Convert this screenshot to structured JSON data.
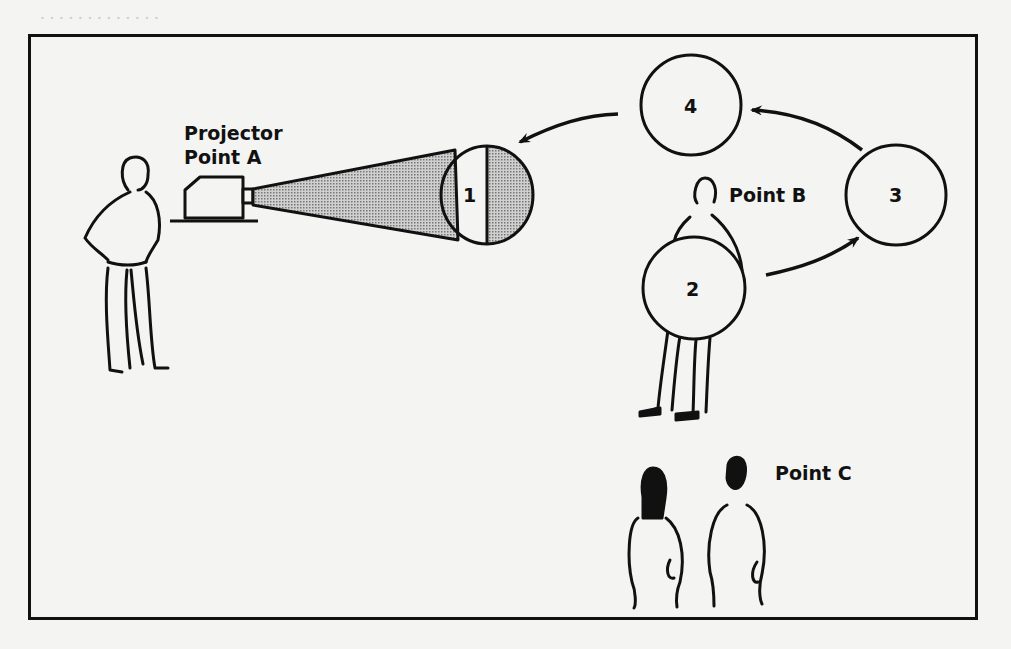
{
  "diagram": {
    "labels": {
      "projector_line1": "Projector",
      "projector_line2": "Point A",
      "point_b": "Point B",
      "point_c": "Point C"
    },
    "positions": [
      {
        "id": "1",
        "label": "1",
        "lit_half": "right"
      },
      {
        "id": "2",
        "label": "2"
      },
      {
        "id": "3",
        "label": "3"
      },
      {
        "id": "4",
        "label": "4"
      }
    ],
    "arrows": [
      {
        "from": "2",
        "to": "3"
      },
      {
        "from": "3",
        "to": "4"
      },
      {
        "from": "4",
        "to": "1"
      }
    ],
    "colors": {
      "ink": "#111111",
      "shade": "#a8a8a8",
      "paper": "#f4f4f2"
    }
  }
}
